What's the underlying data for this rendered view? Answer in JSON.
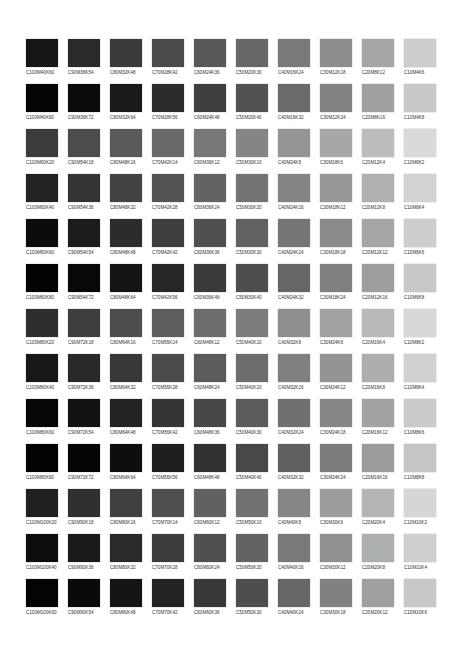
{
  "rows": [
    {
      "labels": [
        "C100M40K60",
        "C90M36K54",
        "C80M32K48",
        "C70M28K42",
        "C60M24K36",
        "C50M20K30",
        "C40M16K24",
        "C30M12K18",
        "C20M8K12",
        "C10M4K6"
      ],
      "colors": [
        "#161618",
        "#2a2a2c",
        "#3a3a3c",
        "#4a4a4c",
        "#58585a",
        "#676769",
        "#79797b",
        "#8d8d8f",
        "#a6a6a8",
        "#cdcdcf"
      ]
    },
    {
      "labels": [
        "C100M40K80",
        "C90M36K72",
        "C80M32K64",
        "C70M28K56",
        "C60M24K48",
        "C50M20K40",
        "C40M16K32",
        "C30M12K24",
        "C20M8K16",
        "C10M4K8"
      ],
      "colors": [
        "#050506",
        "#0b0b0c",
        "#1a1a1b",
        "#2c2c2d",
        "#3e3e40",
        "#525254",
        "#6a6a6c",
        "#838385",
        "#a0a0a2",
        "#c9c9cb"
      ]
    },
    {
      "labels": [
        "C100M60K20",
        "C90M54K18",
        "C80M48K16",
        "C70M42K14",
        "C60M36K12",
        "C50M30K10",
        "C40M24K8",
        "C30M18K6",
        "C20M12K4",
        "C10M6K2"
      ],
      "colors": [
        "#3c3c3e",
        "#4c4c4e",
        "#5a5a5c",
        "#69696b",
        "#77777a",
        "#858587",
        "#959597",
        "#a7a7a9",
        "#bcbcbe",
        "#dadadc"
      ]
    },
    {
      "labels": [
        "C100M60K40",
        "C90M54K36",
        "C80M48K32",
        "C70M42K28",
        "C60M36K24",
        "C50M30K20",
        "C40M24K16",
        "C30M18K12",
        "C20M12K8",
        "C10M6K4"
      ],
      "colors": [
        "#232325",
        "#333335",
        "#434345",
        "#545456",
        "#636365",
        "#737375",
        "#848486",
        "#98989a",
        "#b0b0b2",
        "#d3d3d5"
      ]
    },
    {
      "labels": [
        "C100M60K60",
        "C90M54K54",
        "C80M48K48",
        "C70M42K42",
        "C60M36K36",
        "C50M30K30",
        "C40M24K24",
        "C30M18K18",
        "C20M12K12",
        "C10M6K6"
      ],
      "colors": [
        "#0c0c0d",
        "#1c1c1e",
        "#2c2c2e",
        "#3e3e40",
        "#505052",
        "#626264",
        "#767678",
        "#8b8b8d",
        "#a6a6a8",
        "#cdcdcf"
      ]
    },
    {
      "labels": [
        "C100M60K80",
        "C90M54K72",
        "C80M48K64",
        "C70M42K56",
        "C60M36K48",
        "C50M30K40",
        "C40M24K32",
        "C30M18K24",
        "C20M12K16",
        "C10M6K8"
      ],
      "colors": [
        "#030304",
        "#08080a",
        "#141416",
        "#262628",
        "#3a3a3c",
        "#4e4e50",
        "#666668",
        "#808082",
        "#9e9ea0",
        "#c8c8ca"
      ]
    },
    {
      "labels": [
        "C100M80K20",
        "C90M72K18",
        "C80M64K16",
        "C70M56K14",
        "C60M48K12",
        "C50M40K10",
        "C40M32K8",
        "C30M24K6",
        "C20M16K4",
        "C10M8K2"
      ],
      "colors": [
        "#2e2e30",
        "#3e3e40",
        "#4e4e50",
        "#5e5e60",
        "#6d6d6f",
        "#7c7c7e",
        "#8e8e90",
        "#a2a2a4",
        "#b9b9bb",
        "#d8d8da"
      ]
    },
    {
      "labels": [
        "C100M80K40",
        "C90M72K36",
        "C80M64K32",
        "C70M56K28",
        "C60M48K24",
        "C50M40K20",
        "C40M32K16",
        "C30M24K12",
        "C20M16K8",
        "C10M8K4"
      ],
      "colors": [
        "#18181a",
        "#282829",
        "#38383a",
        "#4a4a4c",
        "#5b5b5d",
        "#6c6c6e",
        "#7f7f81",
        "#949496",
        "#adadaf",
        "#d1d1d3"
      ]
    },
    {
      "labels": [
        "C100M80K60",
        "C90M72K54",
        "C80M64K48",
        "C70M56K42",
        "C60M48K36",
        "C50M40K30",
        "C40M32K24",
        "C30M24K18",
        "C20M16K12",
        "C10M8K6"
      ],
      "colors": [
        "#070708",
        "#121214",
        "#222224",
        "#343436",
        "#474749",
        "#5b5b5d",
        "#707072",
        "#878789",
        "#a3a3a5",
        "#cbcbcd"
      ]
    },
    {
      "labels": [
        "C100M80K80",
        "C90M72K72",
        "C80M64K64",
        "C70M56K56",
        "C60M48K48",
        "C50M40K40",
        "C40M32K32",
        "C30M24K24",
        "C20M16K16",
        "C10M8K8"
      ],
      "colors": [
        "#020203",
        "#050506",
        "#0e0e10",
        "#1e1e20",
        "#323234",
        "#48484a",
        "#606062",
        "#7b7b7d",
        "#9b9b9d",
        "#c6c6c8"
      ]
    },
    {
      "labels": [
        "C100M100K20",
        "C90M90K18",
        "C80M80K16",
        "C70M70K14",
        "C60M60K12",
        "C50M50K10",
        "C40M40K8",
        "C30M30K6",
        "C20M20K4",
        "C10M10K2"
      ],
      "colors": [
        "#202022",
        "#303032",
        "#404042",
        "#505052",
        "#616163",
        "#727274",
        "#868688",
        "#9c9c9e",
        "#b5b5b7",
        "#d6d6d8"
      ]
    },
    {
      "labels": [
        "C100M100K40",
        "C90M90K36",
        "C80M80K32",
        "C70M70K28",
        "C60M60K24",
        "C50M50K20",
        "C40M40K16",
        "C30M30K12",
        "C20M20K8",
        "C10M10K4"
      ],
      "colors": [
        "#0d0d0e",
        "#1a1a1c",
        "#2a2a2c",
        "#3c3c3e",
        "#4f4f51",
        "#636365",
        "#79797b",
        "#909092",
        "#abafad",
        "#cfcfd1"
      ]
    },
    {
      "labels": [
        "C100M100K60",
        "C90M90K54",
        "C80M80K48",
        "C70M70K42",
        "C60M60K36",
        "C50M50K30",
        "C40M40K24",
        "C30M30K18",
        "C20M20K12",
        "C10M10K6"
      ],
      "colors": [
        "#040405",
        "#0a0a0b",
        "#141416",
        "#232325",
        "#38383a",
        "#4e4e50",
        "#666668",
        "#818183",
        "#9f9fa1",
        "#c8c8ca"
      ]
    }
  ]
}
